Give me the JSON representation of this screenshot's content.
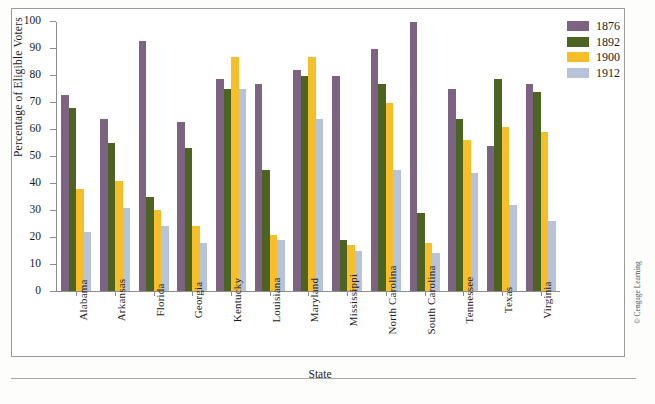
{
  "figure": {
    "credit": "© Cengage Learning"
  },
  "chart_data": {
    "type": "bar",
    "title": "",
    "xlabel": "State",
    "ylabel": "Percentage of Eligible Voters",
    "ylim": [
      0,
      100
    ],
    "ytick_step": 10,
    "yticks": [
      0,
      10,
      20,
      30,
      40,
      50,
      60,
      70,
      80,
      90,
      100
    ],
    "grid": false,
    "legend_position": "top-right",
    "categories": [
      "Alabama",
      "Arkansas",
      "Florida",
      "Georgia",
      "Kentucky",
      "Louisiana",
      "Maryland",
      "Mississippi",
      "North Carolina",
      "South Carolina",
      "Tennessee",
      "Texas",
      "Virginia"
    ],
    "series": [
      {
        "name": "1876",
        "color": "#7d6382",
        "values": [
          73,
          64,
          93,
          63,
          79,
          77,
          82,
          80,
          90,
          100,
          75,
          54,
          77
        ]
      },
      {
        "name": "1892",
        "color": "#4d6321",
        "values": [
          68,
          55,
          35,
          53,
          75,
          45,
          80,
          19,
          77,
          29,
          64,
          79,
          74
        ]
      },
      {
        "name": "1900",
        "color": "#f6bf2a",
        "values": [
          38,
          41,
          30,
          24,
          87,
          21,
          87,
          17,
          70,
          18,
          56,
          61,
          59
        ]
      },
      {
        "name": "1912",
        "color": "#b7c3d8",
        "values": [
          22,
          31,
          24,
          18,
          75,
          19,
          64,
          15,
          45,
          14,
          44,
          32,
          26
        ]
      }
    ]
  }
}
